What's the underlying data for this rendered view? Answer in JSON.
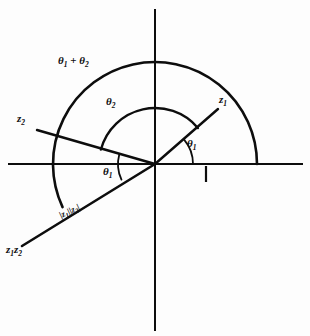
{
  "figure": {
    "background_color": "#fdfdfd",
    "ink_color": "#0d0d0d",
    "origin": {
      "x": 155,
      "y": 164
    }
  },
  "axes": {
    "real_axis": {
      "name": "horizontal-axis",
      "x1": 8,
      "y1": 164,
      "x2": 303,
      "y2": 164
    },
    "imaginary_axis": {
      "name": "vertical-axis",
      "x1": 155,
      "y1": 9,
      "x2": 155,
      "y2": 331
    },
    "unit_tick": {
      "name": "unit-tick-mark",
      "x": 206,
      "y_top": 166,
      "y_bottom": 182
    }
  },
  "rays": [
    {
      "name": "ray-z1",
      "label": "z",
      "sub": "1",
      "angle_deg": 40,
      "end": {
        "x": 218,
        "y": 109
      },
      "label_pos": {
        "x": 219,
        "y": 98
      }
    },
    {
      "name": "ray-z2",
      "label": "z",
      "sub": "2",
      "angle_deg": 165,
      "end": {
        "x": 37,
        "y": 130
      },
      "label_pos": {
        "x": 18,
        "y": 117
      }
    },
    {
      "name": "ray-z1z2",
      "label": "z",
      "sub": "1",
      "label2": "z",
      "sub2": "2",
      "angle_deg": 205,
      "end": {
        "x": 22,
        "y": 246
      },
      "label_pos": {
        "x": 7,
        "y": 248
      }
    }
  ],
  "arcs": [
    {
      "name": "outer-arc",
      "description": "arc of radius |z1||z2| spanning from the z1z2 ray up over the top to the positive real axis",
      "radius": 102,
      "start_angle_deg": 205,
      "end_angle_deg": 0
    },
    {
      "name": "inner-arc",
      "description": "unit-like arc of radius spanning from the z2 ray over the top to the z1 ray",
      "radius": 56,
      "start_angle_deg": 165,
      "end_angle_deg": 40
    },
    {
      "name": "angle-arc-theta1-right",
      "description": "small angle arc between positive real axis and the z1 ray",
      "radius": 38,
      "start_angle_deg": 0,
      "end_angle_deg": 40
    },
    {
      "name": "angle-arc-theta1-left",
      "description": "small angle arc between the z2 ray and the z1z2 ray",
      "radius": 37,
      "start_angle_deg": 165,
      "end_angle_deg": 205
    }
  ],
  "labels": {
    "theta_sum": {
      "name": "label-theta1-plus-theta2",
      "theta": "θ",
      "sub1": "1",
      "plus": " + ",
      "theta2": "θ",
      "sub2": "2",
      "x": 58,
      "y": 60,
      "text": "θ₁ + θ₂"
    },
    "theta2": {
      "name": "label-theta2",
      "theta": "θ",
      "sub": "2",
      "x": 106,
      "y": 100,
      "text": "θ₂"
    },
    "theta1_right": {
      "name": "label-theta1-right",
      "theta": "θ",
      "sub": "1",
      "x": 187,
      "y": 141,
      "text": "θ₁"
    },
    "theta1_left": {
      "name": "label-theta1-left",
      "theta": "θ",
      "sub": "1",
      "x": 103,
      "y": 169,
      "text": "θ₁"
    },
    "z1": {
      "name": "label-z1",
      "base": "z",
      "sub": "1",
      "x": 219,
      "y": 97,
      "text": "z₁"
    },
    "z2": {
      "name": "label-z2",
      "base": "z",
      "sub": "2",
      "x": 17,
      "y": 116,
      "text": "z₂"
    },
    "z1z2": {
      "name": "label-z1z2",
      "base1": "z",
      "sub1": "1",
      "base2": "z",
      "sub2": "2",
      "x": 6,
      "y": 247,
      "text": "z₁z₂"
    },
    "modulus": {
      "name": "label-modulus-product",
      "bar_open": "|",
      "base1": "z",
      "sub1": "1",
      "bar_mid": "||",
      "base2": "z",
      "sub2": "2",
      "bar_close": "|",
      "x": 58,
      "y": 214,
      "rotation_deg": -25,
      "text": "|z₁||z₂|"
    }
  }
}
